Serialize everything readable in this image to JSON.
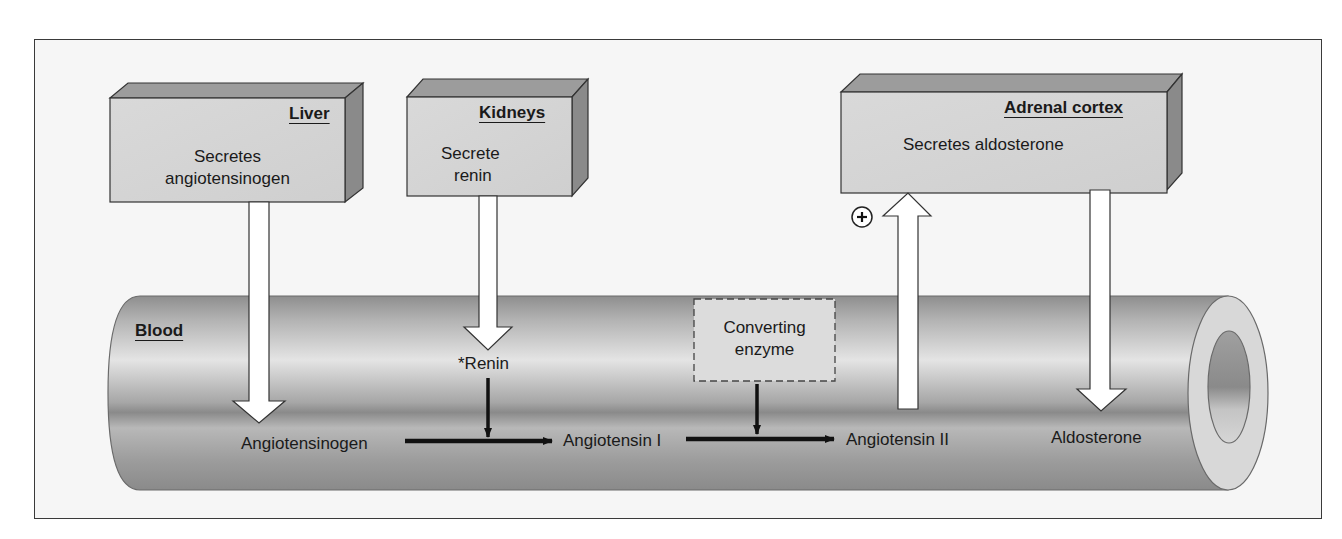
{
  "diagram": {
    "type": "renin-angiotensin-aldosterone pathway",
    "organs": [
      {
        "id": "liver",
        "title": "Liver",
        "text_line1": "Secretes",
        "text_line2": "angiotensinogen"
      },
      {
        "id": "kidneys",
        "title": "Kidneys",
        "text_line1": "Secrete",
        "text_line2": "renin"
      },
      {
        "id": "adrenal",
        "title": "Adrenal cortex",
        "text_line1": "Secretes aldosterone"
      }
    ],
    "vessel": {
      "label": "Blood"
    },
    "enzyme_box": {
      "line1": "Converting",
      "line2": "enzyme"
    },
    "renin_label": "*Renin",
    "stimulus_sign": "+",
    "pathway": [
      "Angiotensinogen",
      "Angiotensin I",
      "Angiotensin II"
    ],
    "aldosterone_label": "Aldosterone",
    "colors": {
      "frame_bg": "#f6f6f6",
      "box_face": "#d6d6d6",
      "box_top": "#9a9a9a",
      "box_side": "#8a8a8a",
      "tube_mid": "#e2e2e2",
      "tube_edge": "#8c8c8c",
      "arrow_fill": "#ffffff",
      "line": "#111111"
    }
  }
}
